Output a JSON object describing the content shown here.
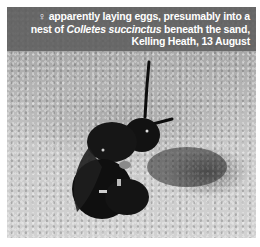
{
  "caption": {
    "symbol": "♀",
    "line1": " apparently laying eggs, presumably into a",
    "line2_pre": "nest of ",
    "line2_species": "Colletes succinctus",
    "line2_post": " beneath the sand,",
    "line3": "Kelling Heath, 13 August"
  },
  "photo": {
    "subject": "bee",
    "background": "sand",
    "colors": {
      "band": "#5f5f5f",
      "text": "#ffffff",
      "sand": "#c8c8c8",
      "bee": "#111111"
    }
  }
}
